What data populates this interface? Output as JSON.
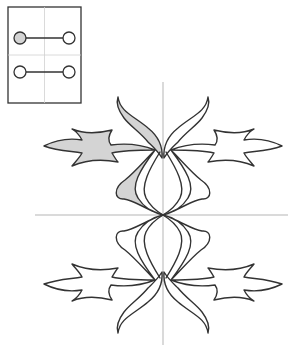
{
  "diagram": {
    "type": "symmetric ornament with mirror guides",
    "colors": {
      "stroke": "#333333",
      "highlight_fill": "#d4d4d4",
      "plain_fill": "#ffffff",
      "guide": "#b5b5b5"
    },
    "legend": {
      "rows": [
        {
          "left_node": "filled",
          "right_node": "empty"
        },
        {
          "left_node": "empty",
          "right_node": "empty"
        }
      ]
    },
    "guides": {
      "vertical_axis_x": 163,
      "horizontal_axis_y": 215
    },
    "highlighted_region": "upper-left quadrant"
  }
}
